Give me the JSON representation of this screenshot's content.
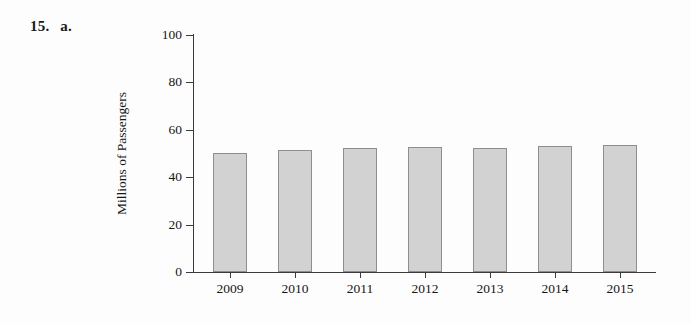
{
  "problem": {
    "number": "15.",
    "part": "a."
  },
  "chart_data": {
    "type": "bar",
    "title": "",
    "xlabel": "",
    "ylabel": "Millions of Passengers",
    "categories": [
      "2009",
      "2010",
      "2011",
      "2012",
      "2013",
      "2014",
      "2015"
    ],
    "values": [
      50.0,
      51.5,
      52.5,
      52.8,
      52.3,
      53.0,
      53.5
    ],
    "ylim": [
      0,
      100
    ],
    "yticks": [
      0,
      20,
      40,
      60,
      80,
      100
    ],
    "ytick_labels": [
      "0",
      "20",
      "40",
      "60",
      "80",
      "100"
    ],
    "grid": false,
    "legend": false,
    "bar_color": "#d2d2d2",
    "bar_edge_color": "#8e8e8e",
    "axis_color": "#3a3a3a"
  }
}
